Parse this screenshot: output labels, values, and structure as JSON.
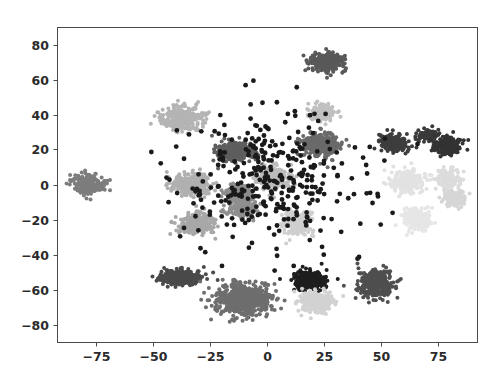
{
  "figure": {
    "background_color": "#ffffff",
    "plot_area": {
      "left": 57,
      "top": 27,
      "right": 477,
      "bottom": 342
    },
    "spine_color": "#4a4a4a"
  },
  "chart_data": {
    "type": "scatter",
    "title": "",
    "xlabel": "",
    "ylabel": "",
    "xlim": [
      -92,
      92
    ],
    "ylim": [
      -90,
      90
    ],
    "grid": false,
    "legend": "none",
    "xticks": [
      -75,
      -50,
      -25,
      0,
      25,
      50,
      75
    ],
    "xtick_labels": [
      "−75",
      "−50",
      "−25",
      "0",
      "25",
      "50",
      "75"
    ],
    "yticks": [
      80,
      60,
      40,
      20,
      0,
      -20,
      -40,
      -60,
      -80
    ],
    "ytick_labels": [
      "80",
      "60",
      "40",
      "20",
      "0",
      "−20",
      "−40",
      "−60",
      "−80"
    ],
    "marker_size": 2.0,
    "clusters": [
      {
        "name": "cluster-01",
        "cx": -78,
        "cy": 0,
        "rx": 8,
        "ry": 7,
        "n": 230,
        "color": "#7d7d7d"
      },
      {
        "name": "cluster-02",
        "cx": -37,
        "cy": 38,
        "rx": 11,
        "ry": 8,
        "n": 300,
        "color": "#b4b4b4"
      },
      {
        "name": "cluster-03",
        "cx": -33,
        "cy": 0,
        "rx": 10,
        "ry": 8,
        "n": 290,
        "color": "#b0b0b0"
      },
      {
        "name": "cluster-04",
        "cx": -31,
        "cy": -22,
        "rx": 9,
        "ry": 7,
        "n": 250,
        "color": "#a8a8a8"
      },
      {
        "name": "cluster-05",
        "cx": -14,
        "cy": 19,
        "rx": 10,
        "ry": 7,
        "n": 280,
        "color": "#5e5e5e"
      },
      {
        "name": "cluster-06",
        "cx": -12,
        "cy": -5,
        "rx": 7,
        "ry": 6,
        "n": 180,
        "color": "#8c8c8c"
      },
      {
        "name": "cluster-07",
        "cx": -11,
        "cy": -14,
        "rx": 7,
        "ry": 6,
        "n": 190,
        "color": "#8f8f8f"
      },
      {
        "name": "cluster-08",
        "cx": 2,
        "cy": 4,
        "rx": 9,
        "ry": 8,
        "n": 240,
        "color": "#bcbcbc"
      },
      {
        "name": "cluster-09",
        "cx": 24,
        "cy": 23,
        "rx": 10,
        "ry": 8,
        "n": 300,
        "color": "#6a6a6a"
      },
      {
        "name": "cluster-10",
        "cx": 26,
        "cy": 70,
        "rx": 9,
        "ry": 6,
        "n": 250,
        "color": "#595959"
      },
      {
        "name": "cluster-11",
        "cx": 24,
        "cy": 41,
        "rx": 7,
        "ry": 5,
        "n": 160,
        "color": "#c0c0c0"
      },
      {
        "name": "cluster-12",
        "cx": 56,
        "cy": 24,
        "rx": 7,
        "ry": 6,
        "n": 180,
        "color": "#3d3d3d"
      },
      {
        "name": "cluster-13",
        "cx": 70,
        "cy": 28,
        "rx": 5,
        "ry": 4,
        "n": 90,
        "color": "#3a3a3a"
      },
      {
        "name": "cluster-14",
        "cx": 79,
        "cy": 22,
        "rx": 7,
        "ry": 6,
        "n": 190,
        "color": "#333333"
      },
      {
        "name": "cluster-15",
        "cx": 62,
        "cy": 2,
        "rx": 9,
        "ry": 8,
        "n": 220,
        "color": "#e2e2e2"
      },
      {
        "name": "cluster-16",
        "cx": 80,
        "cy": 3,
        "rx": 6,
        "ry": 6,
        "n": 150,
        "color": "#dcdcdc"
      },
      {
        "name": "cluster-17",
        "cx": 82,
        "cy": -8,
        "rx": 6,
        "ry": 5,
        "n": 140,
        "color": "#d6d6d6"
      },
      {
        "name": "cluster-18",
        "cx": 66,
        "cy": -20,
        "rx": 8,
        "ry": 8,
        "n": 190,
        "color": "#e6e6e6"
      },
      {
        "name": "cluster-19",
        "cx": 13,
        "cy": -22,
        "rx": 8,
        "ry": 8,
        "n": 230,
        "color": "#cfcfcf"
      },
      {
        "name": "cluster-20",
        "cx": -38,
        "cy": -53,
        "rx": 11,
        "ry": 5,
        "n": 300,
        "color": "#4a4a4a"
      },
      {
        "name": "cluster-21",
        "cx": -10,
        "cy": -66,
        "rx": 15,
        "ry": 11,
        "n": 600,
        "color": "#6e6e6e"
      },
      {
        "name": "cluster-22",
        "cx": 19,
        "cy": -55,
        "rx": 8,
        "ry": 7,
        "n": 300,
        "color": "#1e1e1e"
      },
      {
        "name": "cluster-23",
        "cx": 22,
        "cy": -67,
        "rx": 9,
        "ry": 7,
        "n": 250,
        "color": "#d2d2d2"
      },
      {
        "name": "cluster-24",
        "cx": 48,
        "cy": -57,
        "rx": 9,
        "ry": 9,
        "n": 320,
        "color": "#4f4f4f"
      }
    ],
    "noise": {
      "name": "scattered-noise-points",
      "n": 340,
      "spread_x": 36,
      "spread_y": 36,
      "color": "#1a1a1a"
    }
  }
}
